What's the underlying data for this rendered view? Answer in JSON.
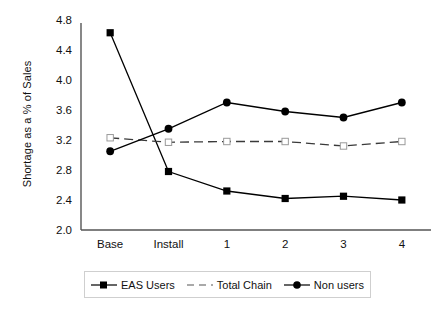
{
  "chart_data": {
    "type": "line",
    "title": "",
    "xlabel": "",
    "ylabel": "Shortage as a % of Sales",
    "categories": [
      "Base",
      "Install",
      "1",
      "2",
      "3",
      "4"
    ],
    "ylim": [
      2.0,
      4.8
    ],
    "yticks": [
      "2.0",
      "2.4",
      "2.8",
      "3.2",
      "3.6",
      "4.0",
      "4.4",
      "4.8"
    ],
    "ytick_values": [
      2.0,
      2.4,
      2.8,
      3.2,
      3.6,
      4.0,
      4.4,
      4.8
    ],
    "grid": false,
    "legend_position": "bottom",
    "series": [
      {
        "name": "EAS Users",
        "marker": "filled-square",
        "line": "solid",
        "color": "#000000",
        "values": [
          4.63,
          2.78,
          2.52,
          2.42,
          2.45,
          2.4
        ]
      },
      {
        "name": "Total Chain",
        "marker": "open-square",
        "line": "dashed",
        "color": "#3a3a3a",
        "values": [
          3.23,
          3.17,
          3.18,
          3.18,
          3.12,
          3.18
        ]
      },
      {
        "name": "Non users",
        "marker": "filled-circle",
        "line": "solid",
        "color": "#000000",
        "values": [
          3.05,
          3.35,
          3.7,
          3.58,
          3.5,
          3.7
        ]
      }
    ]
  },
  "axis": {
    "line_color": "#555555"
  }
}
